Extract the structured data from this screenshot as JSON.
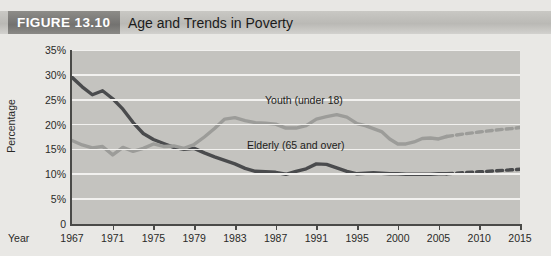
{
  "figure": {
    "number": "FIGURE 13.10",
    "title": "Age and Trends in Poverty"
  },
  "colors": {
    "banner_tab": "#7b7a77",
    "banner_band": "#c2c1bd",
    "plot_background": "#c4c3bf",
    "gridline": "#f2f1ef",
    "elderly_line": "#4a4b4d",
    "youth_line": "#9c9c99",
    "page_background": "#e8e7e4"
  },
  "chart_data": {
    "type": "line",
    "title": "Age and Trends in Poverty",
    "xlabel": "Year",
    "ylabel": "Percentage",
    "ylim": [
      0,
      35
    ],
    "yticks": [
      "0",
      "5%",
      "10%",
      "15%",
      "20%",
      "25%",
      "30%",
      "35%"
    ],
    "ytick_values": [
      0,
      5,
      10,
      15,
      20,
      25,
      30,
      35
    ],
    "xticks": [
      "1967",
      "1971",
      "1975",
      "1979",
      "1983",
      "1987",
      "1991",
      "1995",
      "2000",
      "2005",
      "2010",
      "2015"
    ],
    "xtick_values": [
      1967,
      1971,
      1975,
      1979,
      1983,
      1987,
      1991,
      1995,
      2000,
      2005,
      2010,
      2015
    ],
    "xlim": [
      1967,
      2015
    ],
    "grid": true,
    "legend_position": "inline-annotations",
    "projection_starts_year": 2006,
    "annotations": [
      {
        "text": "Youth (under 18)",
        "series": "youth"
      },
      {
        "text": "Elderly (65 and over)",
        "series": "elderly"
      }
    ],
    "series": [
      {
        "name": "Elderly (65 and over)",
        "label": "Elderly (65 and over)",
        "color": "#4a4b4d",
        "style": "solid-then-dashed",
        "x": [
          1967,
          1968,
          1969,
          1970,
          1971,
          1972,
          1973,
          1974,
          1975,
          1976,
          1977,
          1978,
          1979,
          1980,
          1981,
          1982,
          1983,
          1984,
          1985,
          1986,
          1987,
          1988,
          1989,
          1990,
          1991,
          1992,
          1993,
          1994,
          1995,
          1996,
          1997,
          1998,
          1999,
          2000,
          2001,
          2002,
          2003,
          2004,
          2005,
          2006
        ],
        "values": [
          29.5,
          27.6,
          26.0,
          26.8,
          25.2,
          23.1,
          20.4,
          18.2,
          17.0,
          16.2,
          15.4,
          15.0,
          15.2,
          14.3,
          13.5,
          12.8,
          12.1,
          11.2,
          10.6,
          10.5,
          10.4,
          10.0,
          10.6,
          11.1,
          12.1,
          12.0,
          11.3,
          10.6,
          10.1,
          10.2,
          10.3,
          10.2,
          10.1,
          10.1,
          10.0,
          10.0,
          10.0,
          10.0,
          10.1,
          10.1
        ]
      },
      {
        "name": "Elderly (65 and over) projected",
        "label": "Elderly projected",
        "color": "#4a4b4d",
        "style": "dashed",
        "x": [
          2006,
          2008,
          2010,
          2012,
          2014,
          2015
        ],
        "values": [
          10.1,
          10.3,
          10.5,
          10.7,
          10.9,
          11.0
        ]
      },
      {
        "name": "Youth (under 18)",
        "label": "Youth (under 18)",
        "color": "#9c9c99",
        "style": "solid-then-dashed",
        "x": [
          1967,
          1968,
          1969,
          1970,
          1971,
          1972,
          1973,
          1974,
          1975,
          1976,
          1977,
          1978,
          1979,
          1980,
          1981,
          1982,
          1983,
          1984,
          1985,
          1986,
          1987,
          1988,
          1989,
          1990,
          1991,
          1992,
          1993,
          1994,
          1995,
          1996,
          1997,
          1998,
          1999,
          2000,
          2001,
          2002,
          2003,
          2004,
          2005,
          2006
        ],
        "values": [
          16.8,
          15.9,
          15.3,
          15.6,
          13.9,
          15.4,
          14.6,
          15.2,
          16.1,
          15.6,
          15.7,
          15.2,
          16.0,
          17.5,
          19.2,
          21.1,
          21.4,
          20.8,
          20.4,
          20.3,
          20.1,
          19.3,
          19.3,
          19.8,
          21.1,
          21.6,
          22.0,
          21.5,
          20.2,
          19.8,
          19.2,
          18.6,
          17.1,
          16.1,
          16.1,
          16.5,
          17.2,
          17.3,
          17.1,
          17.6
        ]
      },
      {
        "name": "Youth (under 18) projected",
        "label": "Youth projected",
        "color": "#9c9c99",
        "style": "dashed",
        "x": [
          2006,
          2008,
          2010,
          2012,
          2014,
          2015
        ],
        "values": [
          17.6,
          18.1,
          18.5,
          18.9,
          19.2,
          19.4
        ]
      }
    ]
  }
}
